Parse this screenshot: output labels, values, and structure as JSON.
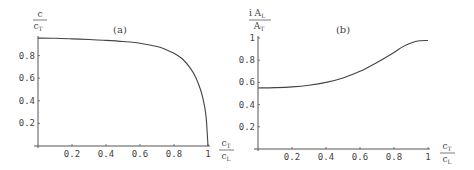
{
  "chart_data": [
    {
      "type": "line",
      "panel_label": "(a)",
      "title": "",
      "ylabel": "c / c_T",
      "xlabel": "c_T / c_L",
      "xlim": [
        0,
        1
      ],
      "ylim": [
        0,
        1
      ],
      "x_ticks": [
        "0.2",
        "0.4",
        "0.6",
        "0.8",
        "1"
      ],
      "y_ticks": [
        "0.2",
        "0.4",
        "0.6",
        "0.8"
      ],
      "grid": false,
      "series": [
        {
          "name": "c/c_T",
          "x": [
            0,
            0.1,
            0.2,
            0.3,
            0.4,
            0.5,
            0.6,
            0.7,
            0.75,
            0.8,
            0.85,
            0.9,
            0.93,
            0.96,
            0.98,
            0.99,
            1.0
          ],
          "y": [
            0.955,
            0.953,
            0.948,
            0.942,
            0.935,
            0.925,
            0.91,
            0.88,
            0.855,
            0.82,
            0.77,
            0.68,
            0.6,
            0.48,
            0.35,
            0.24,
            0.0
          ]
        }
      ]
    },
    {
      "type": "line",
      "panel_label": "(b)",
      "title": "",
      "ylabel": "i A_L / A_T",
      "xlabel": "c_T / c_L",
      "xlim": [
        0,
        1
      ],
      "ylim": [
        0,
        1
      ],
      "x_ticks": [
        "0.2",
        "0.4",
        "0.6",
        "0.8",
        "1"
      ],
      "y_ticks": [
        "0.2",
        "0.4",
        "0.6",
        "0.8",
        "1"
      ],
      "grid": false,
      "series": [
        {
          "name": "i A_L/A_T",
          "x": [
            0,
            0.1,
            0.2,
            0.3,
            0.4,
            0.5,
            0.6,
            0.7,
            0.8,
            0.85,
            0.9,
            0.95,
            1.0
          ],
          "y": [
            0.55,
            0.553,
            0.56,
            0.575,
            0.6,
            0.64,
            0.7,
            0.78,
            0.87,
            0.92,
            0.955,
            0.975,
            0.978
          ]
        }
      ]
    }
  ],
  "panels": {
    "a": {
      "label": "(a)",
      "ylabel_num": "c",
      "ylabel_den": "c",
      "ylabel_den_sub": "T",
      "xlabel_num": "c",
      "xlabel_num_sub": "T",
      "xlabel_den": "c",
      "xlabel_den_sub": "L"
    },
    "b": {
      "label": "(b)",
      "ylabel_num": "i A",
      "ylabel_num_sub": "L",
      "ylabel_den": "A",
      "ylabel_den_sub": "T",
      "xlabel_num": "c",
      "xlabel_num_sub": "T",
      "xlabel_den": "c",
      "xlabel_den_sub": "L"
    }
  }
}
